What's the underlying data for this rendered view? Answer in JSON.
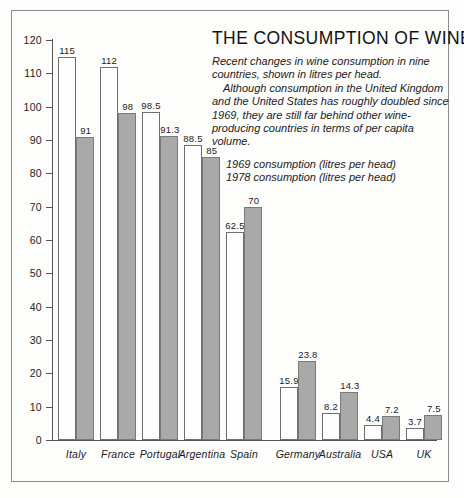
{
  "chart_data": {
    "type": "bar",
    "title": "THE CONSUMPTION OF WINE",
    "description_lines": [
      "Recent changes in wine consumption in nine",
      "countries, shown in litres per head.",
      "Although consumption in the United Kingdom",
      "and the United States has roughly doubled since",
      "1969, they are still far behind other wine-",
      "producing countries in terms of per capita volume."
    ],
    "categories": [
      "Italy",
      "France",
      "Portugal",
      "Argentina",
      "Spain",
      "Germany",
      "Australia",
      "USA",
      "UK"
    ],
    "series": [
      {
        "name": "1969 consumption (litres per head)",
        "color": "#fefefe",
        "values": [
          115,
          112,
          98.5,
          88.5,
          62.5,
          15.9,
          8.2,
          4.4,
          3.7
        ]
      },
      {
        "name": "1978 consumption (litres per head)",
        "color": "#a9a9a9",
        "values": [
          91,
          98,
          91.3,
          85,
          70,
          23.8,
          14.3,
          7.2,
          7.5
        ]
      }
    ],
    "xlabel": "",
    "ylabel": "",
    "ylim": [
      0,
      120
    ],
    "ytick_labels": [
      "120",
      "110",
      "100",
      "90",
      "80",
      "70",
      "60",
      "50",
      "40",
      "30",
      "20",
      "10",
      "0"
    ],
    "ytick_values": [
      120,
      110,
      100,
      90,
      80,
      70,
      60,
      50,
      40,
      30,
      20,
      10,
      0
    ],
    "grid": false,
    "legend_position": "upper-right",
    "value_labels": {
      "1969": [
        "115",
        "112",
        "98.5",
        "88.5",
        "62.5",
        "15.9",
        "8.2",
        "4.4",
        "3.7"
      ],
      "1978": [
        "91",
        "98",
        "91.3",
        "85",
        "70",
        "23.8",
        "14.3",
        "7.2",
        "7.5"
      ]
    }
  }
}
